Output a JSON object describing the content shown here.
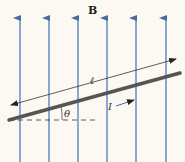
{
  "diagram": {
    "title": "B",
    "field_label": "B",
    "length_label": "ℓ",
    "angle_label": "θ",
    "current_label": "I",
    "colors": {
      "background": "#fbf9f1",
      "field_line": "#6f93c8",
      "wire": "#555555",
      "annotation": "#333333"
    },
    "field_lines_x": [
      20,
      49,
      78,
      107,
      136,
      166
    ]
  }
}
